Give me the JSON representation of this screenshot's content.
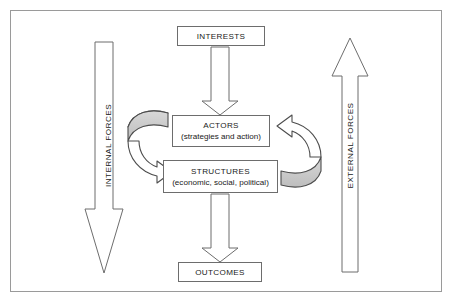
{
  "figure": {
    "type": "flow-diagram",
    "border_color": "#9a9a9a",
    "background": "#ffffff",
    "stroke_color": "#6d6d6d",
    "shaded_fill": "#cfcfcf"
  },
  "nodes": {
    "interests": {
      "title": "INTERESTS",
      "subtitle": ""
    },
    "actors": {
      "title": "ACTORS",
      "subtitle": "(strategies and action)"
    },
    "structures": {
      "title": "STRUCTURES",
      "subtitle": "(economic, social, political)"
    },
    "outcomes": {
      "title": "OUTCOMES",
      "subtitle": ""
    }
  },
  "forces": {
    "internal": {
      "label": "INTERNAL FORCES",
      "direction": "down"
    },
    "external": {
      "label": "EXTERNAL FORCES",
      "direction": "up"
    }
  },
  "connectors": [
    {
      "name": "interests-to-actors",
      "style": "block-arrow",
      "direction": "down",
      "from": "interests",
      "to": "actors"
    },
    {
      "name": "structures-to-outcomes",
      "style": "block-arrow",
      "direction": "down",
      "from": "structures",
      "to": "outcomes"
    },
    {
      "name": "actors-to-structures",
      "style": "curved-arrow",
      "direction": "clockwise-left",
      "from": "actors",
      "to": "structures"
    },
    {
      "name": "structures-to-actors",
      "style": "curved-arrow",
      "direction": "clockwise-right",
      "from": "structures",
      "to": "actors"
    }
  ]
}
